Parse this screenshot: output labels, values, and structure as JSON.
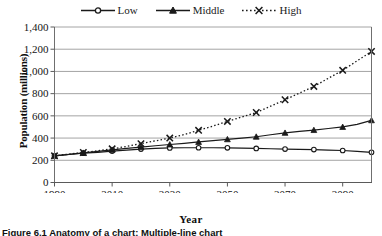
{
  "figure": {
    "caption": "Figure 6.1  Anatomy of a chart: Multiple-line chart"
  },
  "legend": {
    "position": "top-center",
    "entries": [
      {
        "label": "Low",
        "marker": "circle-marker-icon",
        "line": "solid",
        "color": "#1a1a1a"
      },
      {
        "label": "Middle",
        "marker": "triangle-marker-icon",
        "line": "solid",
        "color": "#1a1a1a"
      },
      {
        "label": "High",
        "marker": "x-marker-icon",
        "line": "dotted",
        "color": "#1a1a1a"
      }
    ]
  },
  "axes": {
    "x_title": "Year",
    "y_title": "Population (millions)",
    "x_tick_labels": [
      "1990",
      "2010",
      "2030",
      "2050",
      "2070",
      "2090"
    ],
    "y_tick_labels": [
      "0",
      "200",
      "400",
      "600",
      "800",
      "1,000",
      "1,200",
      "1,400"
    ]
  },
  "chart_data": {
    "type": "line",
    "title": "",
    "subtitle": "",
    "xlabel": "Year",
    "ylabel": "Population (millions)",
    "xlim": [
      1990,
      2100
    ],
    "ylim": [
      0,
      1400
    ],
    "xticks": [
      1990,
      2010,
      2030,
      2050,
      2070,
      2090
    ],
    "yticks": [
      0,
      200,
      400,
      600,
      800,
      1000,
      1200,
      1400
    ],
    "grid": "horizontal",
    "legend_position": "top-center",
    "x": [
      1990,
      1995,
      2000,
      2005,
      2010,
      2015,
      2020,
      2025,
      2030,
      2035,
      2040,
      2045,
      2050,
      2055,
      2060,
      2065,
      2070,
      2075,
      2080,
      2085,
      2090,
      2095,
      2100
    ],
    "series": [
      {
        "name": "Low",
        "marker": "circle",
        "linestyle": "solid",
        "values": [
          240,
          252,
          264,
          272,
          283,
          292,
          301,
          307,
          311,
          313,
          313,
          313,
          312,
          310,
          307,
          304,
          301,
          299,
          296,
          292,
          288,
          281,
          272
        ]
      },
      {
        "name": "Middle",
        "marker": "triangle",
        "linestyle": "solid",
        "values": [
          240,
          254,
          267,
          280,
          294,
          307,
          319,
          331,
          342,
          353,
          365,
          377,
          389,
          400,
          412,
          430,
          447,
          460,
          472,
          486,
          500,
          523,
          560
        ]
      },
      {
        "name": "High",
        "marker": "x",
        "linestyle": "dotted",
        "values": [
          240,
          256,
          270,
          285,
          303,
          325,
          350,
          375,
          400,
          432,
          470,
          508,
          550,
          590,
          630,
          687,
          745,
          805,
          865,
          938,
          1010,
          1095,
          1180
        ]
      }
    ]
  }
}
